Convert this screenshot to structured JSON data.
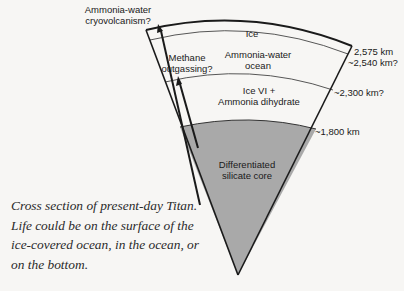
{
  "diagram": {
    "title": "Cross section of present-day Titan",
    "layers": [
      {
        "name": "Ice",
        "radius_label": "2,575 km"
      },
      {
        "name": "Ammonia-water ocean",
        "line1": "Ammonia-water",
        "line2": "ocean",
        "radius_label": "~2,540 km?"
      },
      {
        "name": "Ice VI + Ammonia dihydrate",
        "line1": "Ice VI +",
        "line2": "Ammonia dihydrate",
        "radius_label": "~2,300 km?"
      },
      {
        "name": "Differentiated silicate core",
        "line1": "Differentiated",
        "line2": "silicate core",
        "radius_label": "~1,800 km"
      }
    ],
    "annotations": [
      {
        "id": "cryovolcanism",
        "line1": "Ammonia-water",
        "line2": "cryovolcanism?"
      },
      {
        "id": "methane",
        "line1": "Methane",
        "line2": "outgassing?"
      }
    ],
    "colors": {
      "core": "#a9a9a9",
      "line": "#1a1a1a",
      "background": "#f7f6f4"
    }
  },
  "caption": "Cross section of present-day Titan. Life could be on the surface of the ice-covered ocean, in the ocean, or on the bottom."
}
